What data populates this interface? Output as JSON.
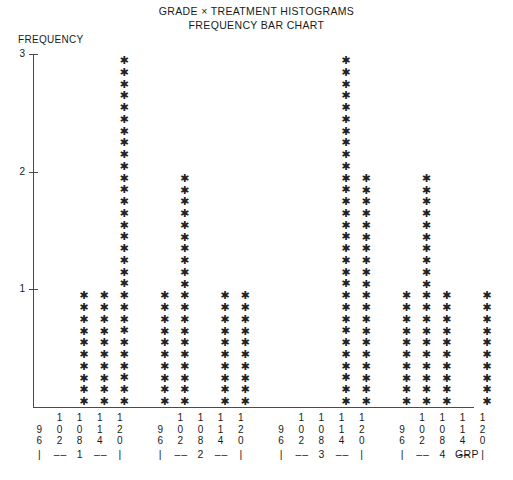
{
  "header": {
    "title_line1": "GRADE × TREATMENT HISTOGRAMS",
    "title_line2": "FREQUENCY BAR CHART"
  },
  "axes": {
    "y_axis_label": "FREQUENCY",
    "y_ticks": [
      "1",
      "2",
      "3"
    ],
    "x_group_axis_name": "GRP",
    "group_separator": "|",
    "group_dash": "–"
  },
  "marker": {
    "glyph": "✱",
    "color": "#222222"
  },
  "chart_data": {
    "type": "bar",
    "xlabel": "GRP",
    "ylabel": "FREQUENCY",
    "ylim": [
      0,
      3
    ],
    "yticks": [
      1,
      2,
      3
    ],
    "grid": false,
    "legend": false,
    "note": "Stacked-asterisk (character plot) histogram; one '*' per frequency unit, 10 glyphs drawn per frequency unit of height.",
    "glyphs_per_unit": 10,
    "categories": [
      "96",
      "102",
      "108",
      "114",
      "120"
    ],
    "groups": [
      {
        "group": "1",
        "label": "1",
        "bins": [
          "96",
          "102",
          "108",
          "114",
          "120"
        ],
        "values": [
          0,
          0,
          1,
          1,
          3
        ]
      },
      {
        "group": "2",
        "label": "2",
        "bins": [
          "96",
          "102",
          "108",
          "114",
          "120"
        ],
        "values": [
          1,
          2,
          0,
          1,
          1
        ]
      },
      {
        "group": "3",
        "label": "3",
        "bins": [
          "96",
          "102",
          "108",
          "114",
          "120"
        ],
        "values": [
          0,
          0,
          0,
          3,
          2
        ]
      },
      {
        "group": "4",
        "label": "4",
        "bins": [
          "96",
          "102",
          "108",
          "114",
          "120"
        ],
        "values": [
          1,
          2,
          1,
          0,
          1
        ]
      }
    ]
  }
}
